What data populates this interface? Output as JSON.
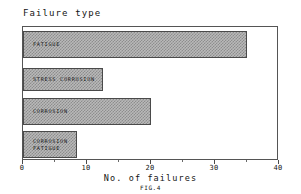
{
  "chart_data": {
    "type": "bar",
    "orientation": "horizontal",
    "title": "Failure type",
    "subtitle": "",
    "xlabel": "No. of failures",
    "ylabel": "Failure type",
    "xlim": [
      0,
      40
    ],
    "xticks": [
      0,
      10,
      20,
      30,
      40
    ],
    "xtick_labels": [
      "0",
      "10",
      "20",
      "30",
      "40"
    ],
    "xminor_ticks": [
      5,
      15,
      25,
      35
    ],
    "grid": false,
    "legend": null,
    "caption": "FIG.4",
    "categories": [
      "FATIGUE",
      "STRESS CORROSION",
      "CORROSION",
      "CORROSION\nFATIGUE"
    ],
    "values": [
      35,
      12.5,
      20,
      8.5
    ],
    "bars": [
      {
        "label": "FATIGUE",
        "value": 35
      },
      {
        "label": "STRESS CORROSION",
        "value": 12.5
      },
      {
        "label": "CORROSION",
        "value": 20
      },
      {
        "label": "CORROSION\nFATIGUE",
        "value": 8.5
      }
    ],
    "colors": {
      "bar_fill": "#b9b9b9",
      "bar_hatch": "#8d8d8d",
      "bar_edge": "#4a4a4a",
      "axis": "#555555",
      "text": "#141414",
      "background": "#ffffff"
    }
  }
}
